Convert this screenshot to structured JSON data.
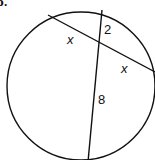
{
  "problem": {
    "label": "b."
  },
  "diagram": {
    "type": "intersecting-chords",
    "circle": {
      "cx": 81,
      "cy": 86,
      "r": 74
    },
    "chords": [
      {
        "name": "chord-1",
        "from": [
          48,
          15
        ],
        "to": [
          155,
          72
        ]
      },
      {
        "name": "chord-2",
        "from": [
          102,
          10
        ],
        "to": [
          88,
          162
        ]
      }
    ],
    "segment_labels": [
      {
        "text": "x",
        "x": 67,
        "y": 44,
        "italic": true
      },
      {
        "text": "2",
        "x": 104,
        "y": 34,
        "italic": false
      },
      {
        "text": "x",
        "x": 121,
        "y": 73,
        "italic": true
      },
      {
        "text": "8",
        "x": 98,
        "y": 104,
        "italic": false
      }
    ],
    "stroke_color": "#111111"
  }
}
